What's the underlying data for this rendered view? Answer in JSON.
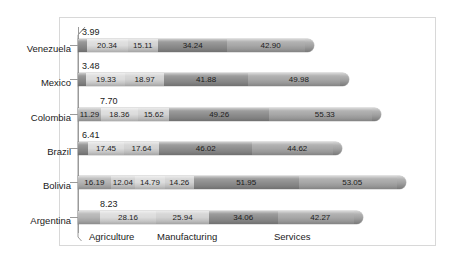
{
  "chart_data": {
    "type": "bar",
    "subtype": "stacked-horizontal-bar-3d",
    "title": "",
    "xlabel": "",
    "ylabel": "",
    "grid": false,
    "legend": "none",
    "categories": [
      "Venezuela",
      "Mexico",
      "Colombia",
      "Brazil",
      "Bolivia",
      "Argentina"
    ],
    "category_axis_captions": [
      "Agriculture",
      "Manufacturing",
      "Services"
    ],
    "series": [
      {
        "name": "s1",
        "values": [
          4.21,
          4.18,
          11.29,
          5.17,
          16.19,
          10.68
        ]
      },
      {
        "name": "s2",
        "values": [
          3.99,
          3.48,
          7.7,
          6.41,
          12.04,
          8.23
        ]
      },
      {
        "name": "s3",
        "values": [
          20.34,
          19.33,
          18.36,
          17.45,
          14.79,
          28.16
        ]
      },
      {
        "name": "s4",
        "values": [
          15.11,
          18.97,
          15.62,
          17.64,
          14.26,
          25.94
        ]
      },
      {
        "name": "s5",
        "values": [
          34.24,
          41.88,
          49.26,
          46.02,
          51.95,
          34.06
        ]
      },
      {
        "name": "s6",
        "values": [
          42.9,
          49.98,
          55.33,
          44.62,
          53.05,
          42.27
        ]
      }
    ],
    "rows": [
      {
        "country": "Venezuela",
        "top_label": "3.99",
        "segments": [
          {
            "label": "4.21",
            "value": 4.21,
            "color": "#8c8c8c"
          },
          {
            "label": "20.34",
            "value": 20.34,
            "color": "#dcdcdc"
          },
          {
            "label": "15.11",
            "value": 15.11,
            "color": "#d2d2d2"
          },
          {
            "label": "34.24",
            "value": 34.24,
            "color": "#8f8f8f"
          },
          {
            "label": "42.90",
            "value": 42.9,
            "color": "#a8a8a8"
          }
        ]
      },
      {
        "country": "Mexico",
        "top_label": "3.48",
        "segments": [
          {
            "label": "4.18",
            "value": 4.18,
            "color": "#8c8c8c"
          },
          {
            "label": "19.33",
            "value": 19.33,
            "color": "#dcdcdc"
          },
          {
            "label": "18.97",
            "value": 18.97,
            "color": "#d2d2d2"
          },
          {
            "label": "41.88",
            "value": 41.88,
            "color": "#8f8f8f"
          },
          {
            "label": "49.98",
            "value": 49.98,
            "color": "#a8a8a8"
          }
        ]
      },
      {
        "country": "Colombia",
        "top_label": "7.70",
        "segments": [
          {
            "label": "11.29",
            "value": 11.29,
            "color": "#b4b4b4"
          },
          {
            "label": "18.36",
            "value": 18.36,
            "color": "#dcdcdc"
          },
          {
            "label": "15.62",
            "value": 15.62,
            "color": "#d2d2d2"
          },
          {
            "label": "49.26",
            "value": 49.26,
            "color": "#8f8f8f"
          },
          {
            "label": "55.33",
            "value": 55.33,
            "color": "#a8a8a8"
          }
        ]
      },
      {
        "country": "Brazil",
        "top_label": "6.41",
        "segments": [
          {
            "label": "5.17",
            "value": 5.17,
            "color": "#8c8c8c"
          },
          {
            "label": "17.45",
            "value": 17.45,
            "color": "#dcdcdc"
          },
          {
            "label": "17.64",
            "value": 17.64,
            "color": "#d2d2d2"
          },
          {
            "label": "46.02",
            "value": 46.02,
            "color": "#8f8f8f"
          },
          {
            "label": "44.62",
            "value": 44.62,
            "color": "#a8a8a8"
          }
        ]
      },
      {
        "country": "Bolivia",
        "top_label": "",
        "segments": [
          {
            "label": "16.19",
            "value": 16.19,
            "color": "#b4b4b4"
          },
          {
            "label": "12.04",
            "value": 12.04,
            "color": "#cfcfcf"
          },
          {
            "label": "14.79",
            "value": 14.79,
            "color": "#dcdcdc"
          },
          {
            "label": "14.26",
            "value": 14.26,
            "color": "#d2d2d2"
          },
          {
            "label": "51.95",
            "value": 51.95,
            "color": "#8f8f8f"
          },
          {
            "label": "53.05",
            "value": 53.05,
            "color": "#a8a8a8"
          }
        ]
      },
      {
        "country": "Argentina",
        "top_label": "8.23",
        "segments": [
          {
            "label": "10.68",
            "value": 10.68,
            "color": "#b4b4b4"
          },
          {
            "label": "28.16",
            "value": 28.16,
            "color": "#dcdcdc"
          },
          {
            "label": "25.94",
            "value": 25.94,
            "color": "#d2d2d2"
          },
          {
            "label": "34.06",
            "value": 34.06,
            "color": "#8f8f8f"
          },
          {
            "label": "42.27",
            "value": 42.27,
            "color": "#a8a8a8"
          }
        ]
      }
    ]
  }
}
